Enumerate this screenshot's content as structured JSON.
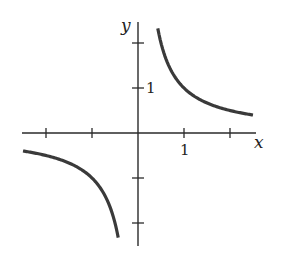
{
  "chart_data": {
    "type": "line",
    "title": "",
    "function": "y = 1/x",
    "xlabel": "x",
    "ylabel": "y",
    "xlim": [
      -2.5,
      2.6
    ],
    "ylim": [
      -2.5,
      2.4
    ],
    "grid": false,
    "legend": null,
    "x_ticks": [
      -2,
      -1,
      1,
      2
    ],
    "y_ticks": [
      -2,
      -1,
      1,
      2
    ],
    "x_tick_labels": {
      "1": "1"
    },
    "y_tick_labels": {
      "1": "1"
    },
    "series": [
      {
        "name": "right branch",
        "x": [
          0.43,
          0.5,
          0.75,
          1,
          1.5,
          2,
          2.5
        ],
        "y": [
          2.33,
          2.0,
          1.33,
          1.0,
          0.67,
          0.5,
          0.4
        ]
      },
      {
        "name": "left branch",
        "x": [
          -2.5,
          -2,
          -1.5,
          -1,
          -0.75,
          -0.5,
          -0.43
        ],
        "y": [
          -0.4,
          -0.5,
          -0.67,
          -1.0,
          -1.33,
          -2.0,
          -2.33
        ]
      }
    ],
    "colors": {
      "axis": "#2a2a2a",
      "curve": "#3a3a3a",
      "background": "#ffffff"
    }
  },
  "labels": {
    "x_axis": "x",
    "y_axis": "y",
    "x_tick_one": "1",
    "y_tick_one": "1"
  }
}
